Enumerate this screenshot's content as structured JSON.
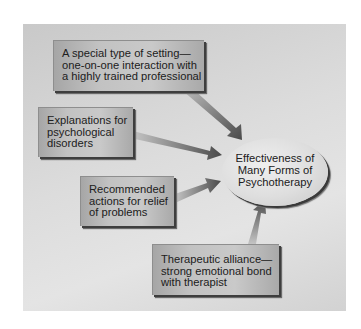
{
  "diagram": {
    "type": "flow-convergence",
    "background_color": "#d8d8d8",
    "target": {
      "lines": [
        "Effectiveness of",
        "Many Forms of",
        "Psychotherapy"
      ]
    },
    "factors": [
      {
        "id": "setting",
        "lines": [
          "A special type of setting—",
          "one-on-one interaction with",
          "a highly trained professional"
        ]
      },
      {
        "id": "explanations",
        "lines": [
          "Explanations for",
          "psychological",
          "disorders"
        ]
      },
      {
        "id": "actions",
        "lines": [
          "Recommended",
          "actions for relief",
          "of problems"
        ]
      },
      {
        "id": "alliance",
        "lines": [
          "Therapeutic alliance—",
          "strong emotional bond",
          "with therapist"
        ]
      }
    ],
    "arrows": [
      {
        "from": "setting",
        "to": "target"
      },
      {
        "from": "explanations",
        "to": "target"
      },
      {
        "from": "actions",
        "to": "target"
      },
      {
        "from": "alliance",
        "to": "target"
      }
    ]
  }
}
